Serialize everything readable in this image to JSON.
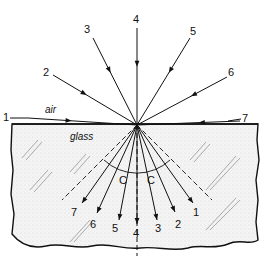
{
  "diagram": {
    "media": {
      "upper": "air",
      "lower": "glass"
    },
    "origin": [
      137,
      125
    ],
    "incident_rays": [
      {
        "label": "1",
        "start": [
          28,
          118
        ],
        "label_pos": [
          3,
          121
        ]
      },
      {
        "label": "2",
        "start": [
          53,
          75
        ],
        "label_pos": [
          43,
          76
        ]
      },
      {
        "label": "3",
        "start": [
          93,
          38
        ],
        "label_pos": [
          84,
          33
        ]
      },
      {
        "label": "4",
        "start": [
          137,
          28
        ],
        "label_pos": [
          133,
          23
        ]
      },
      {
        "label": "5",
        "start": [
          190,
          38
        ],
        "label_pos": [
          190,
          35
        ]
      },
      {
        "label": "6",
        "start": [
          227,
          77
        ],
        "label_pos": [
          228,
          76
        ]
      },
      {
        "label": "7",
        "start": [
          240,
          121
        ],
        "label_pos": [
          242,
          122
        ]
      }
    ],
    "refracted_rays": [
      {
        "label": "7",
        "end": [
          82,
          203
        ],
        "label_pos": [
          71,
          216
        ]
      },
      {
        "label": "6",
        "end": [
          97,
          213
        ],
        "label_pos": [
          90,
          228
        ]
      },
      {
        "label": "5",
        "end": [
          119,
          220
        ],
        "label_pos": [
          112,
          232
        ]
      },
      {
        "label": "4",
        "end": [
          137,
          224
        ],
        "label_pos": [
          133,
          237
        ]
      },
      {
        "label": "3",
        "end": [
          157,
          220
        ],
        "label_pos": [
          155,
          232
        ]
      },
      {
        "label": "2",
        "end": [
          175,
          212
        ],
        "label_pos": [
          175,
          228
        ]
      },
      {
        "label": "1",
        "end": [
          193,
          203
        ],
        "label_pos": [
          193,
          216
        ]
      }
    ],
    "critical_angle_label": "C",
    "critical_angle_labels": [
      [
        119,
        184
      ],
      [
        147,
        184
      ]
    ],
    "normal_line": {
      "from": [
        137,
        125
      ],
      "to": [
        137,
        256
      ]
    }
  }
}
